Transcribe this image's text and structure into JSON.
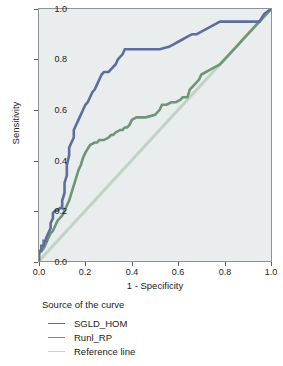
{
  "chart_data": {
    "type": "line",
    "title": "",
    "xlabel": "1 - Specificity",
    "ylabel": "Sensitivity",
    "xlim": [
      0.0,
      1.0
    ],
    "ylim": [
      0.0,
      1.0
    ],
    "xticks": [
      "0.0",
      "0.2",
      "0.4",
      "0.6",
      "0.8",
      "1.0"
    ],
    "yticks": [
      "0.0",
      "0.2",
      "0.4",
      "0.6",
      "0.8",
      "1.0"
    ],
    "grid": false,
    "legend_position": "below-axis",
    "legend_title": "Source of the curve",
    "series": [
      {
        "name": "SGLD_HOM",
        "color": "#5d6e9e",
        "x": [
          0.0,
          0.0,
          0.01,
          0.01,
          0.02,
          0.02,
          0.03,
          0.03,
          0.04,
          0.05,
          0.05,
          0.06,
          0.06,
          0.07,
          0.08,
          0.09,
          0.1,
          0.1,
          0.11,
          0.11,
          0.12,
          0.12,
          0.13,
          0.13,
          0.14,
          0.15,
          0.15,
          0.16,
          0.17,
          0.18,
          0.19,
          0.2,
          0.21,
          0.22,
          0.23,
          0.24,
          0.25,
          0.26,
          0.27,
          0.28,
          0.29,
          0.3,
          0.31,
          0.33,
          0.34,
          0.36,
          0.37,
          0.38,
          0.38,
          0.45,
          0.52,
          0.56,
          0.58,
          0.6,
          0.62,
          0.64,
          0.66,
          0.68,
          0.7,
          0.72,
          0.74,
          0.76,
          0.78,
          0.95,
          0.97,
          1.0
        ],
        "y": [
          0.0,
          0.04,
          0.04,
          0.06,
          0.06,
          0.08,
          0.08,
          0.09,
          0.11,
          0.13,
          0.15,
          0.17,
          0.19,
          0.2,
          0.2,
          0.21,
          0.21,
          0.24,
          0.27,
          0.31,
          0.34,
          0.38,
          0.42,
          0.45,
          0.47,
          0.49,
          0.52,
          0.54,
          0.56,
          0.58,
          0.6,
          0.62,
          0.63,
          0.65,
          0.67,
          0.68,
          0.7,
          0.72,
          0.74,
          0.75,
          0.75,
          0.75,
          0.76,
          0.78,
          0.8,
          0.82,
          0.84,
          0.84,
          0.84,
          0.84,
          0.84,
          0.85,
          0.86,
          0.87,
          0.88,
          0.89,
          0.9,
          0.9,
          0.91,
          0.92,
          0.93,
          0.94,
          0.95,
          0.95,
          0.98,
          1.0
        ]
      },
      {
        "name": "Runl_RP",
        "color": "#6f9477",
        "x": [
          0.0,
          0.0,
          0.01,
          0.02,
          0.03,
          0.04,
          0.05,
          0.06,
          0.07,
          0.08,
          0.09,
          0.1,
          0.11,
          0.12,
          0.13,
          0.14,
          0.15,
          0.16,
          0.17,
          0.18,
          0.19,
          0.2,
          0.22,
          0.24,
          0.25,
          0.26,
          0.28,
          0.3,
          0.31,
          0.32,
          0.33,
          0.35,
          0.36,
          0.37,
          0.38,
          0.39,
          0.4,
          0.42,
          0.46,
          0.5,
          0.52,
          0.53,
          0.55,
          0.57,
          0.59,
          0.61,
          0.62,
          0.64,
          0.65,
          0.67,
          0.69,
          0.7,
          0.72,
          0.74,
          0.76,
          0.78,
          0.8,
          0.82,
          0.84,
          0.86,
          0.88,
          0.9,
          0.92,
          0.94,
          0.96,
          0.98,
          1.0
        ],
        "y": [
          0.0,
          0.03,
          0.04,
          0.05,
          0.07,
          0.09,
          0.11,
          0.12,
          0.14,
          0.16,
          0.17,
          0.18,
          0.2,
          0.22,
          0.24,
          0.27,
          0.3,
          0.33,
          0.36,
          0.38,
          0.41,
          0.43,
          0.46,
          0.47,
          0.47,
          0.48,
          0.48,
          0.49,
          0.5,
          0.5,
          0.51,
          0.52,
          0.52,
          0.53,
          0.53,
          0.54,
          0.56,
          0.57,
          0.57,
          0.58,
          0.6,
          0.62,
          0.62,
          0.63,
          0.63,
          0.64,
          0.65,
          0.65,
          0.68,
          0.7,
          0.72,
          0.74,
          0.75,
          0.76,
          0.77,
          0.78,
          0.8,
          0.82,
          0.84,
          0.86,
          0.88,
          0.9,
          0.92,
          0.94,
          0.96,
          0.98,
          1.0
        ]
      },
      {
        "name": "Reference line",
        "color": "#c3d2c6",
        "x": [
          0.0,
          1.0
        ],
        "y": [
          0.0,
          1.0
        ]
      }
    ]
  },
  "axes": {
    "x_title": "1 - Specificity",
    "y_title": "Sensitivity",
    "x_ticks": [
      "0.0",
      "0.2",
      "0.4",
      "0.6",
      "0.8",
      "1.0"
    ],
    "y_ticks": [
      "0.0",
      "0.2",
      "0.4",
      "0.6",
      "0.8",
      "1.0"
    ]
  },
  "legend": {
    "title": "Source of the curve",
    "entries": [
      {
        "label": "SGLD_HOM",
        "color": "#5d6e9e"
      },
      {
        "label": "Runl_RP",
        "color": "#6f9477"
      },
      {
        "label": "Reference line",
        "color": "#c3d2c6"
      }
    ]
  },
  "colors": {
    "plot_background": "#e9eded",
    "plot_border": "#8d9295",
    "text": "#1c1c1c",
    "page_background": "#ffffff"
  }
}
